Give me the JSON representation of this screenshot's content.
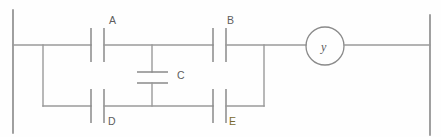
{
  "diagram": {
    "type": "ladder-logic",
    "colors": {
      "wire": "#9a9a9a",
      "rail": "#8f8f8f",
      "label": "#5d5d5d",
      "accent_label": "#7a6a2e",
      "background": "#fefefe"
    },
    "contacts": [
      {
        "id": "A",
        "label": "A",
        "kind": "normally-open",
        "orientation": "vertical-bars",
        "branch": "upper-left",
        "accent": false
      },
      {
        "id": "B",
        "label": "B",
        "kind": "normally-open",
        "orientation": "vertical-bars",
        "branch": "upper-right",
        "accent": false
      },
      {
        "id": "C",
        "label": "C",
        "kind": "normally-open",
        "orientation": "horizontal-bars",
        "branch": "cross-link",
        "accent": false
      },
      {
        "id": "D",
        "label": "D",
        "kind": "normally-open",
        "orientation": "vertical-bars",
        "branch": "lower-left",
        "accent": false
      },
      {
        "id": "E",
        "label": "E",
        "kind": "normally-open",
        "orientation": "vertical-bars",
        "branch": "lower-right",
        "accent": true
      }
    ],
    "coil": {
      "id": "y",
      "label": "y",
      "shape": "circle",
      "position": "output-right"
    },
    "rails": {
      "left_label": "left-power-rail",
      "right_label": "right-power-rail"
    }
  }
}
